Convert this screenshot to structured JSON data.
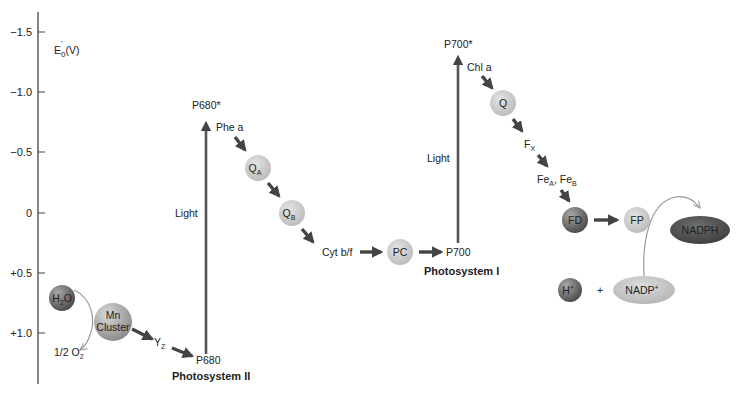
{
  "diagram": {
    "axis": {
      "label_main": "E",
      "label_sub": "0",
      "label_sup": "'",
      "label_unit": "(V)",
      "ticks": [
        "−1.5",
        "−1.0",
        "−0.5",
        "0",
        "+0.5",
        "+1.0"
      ]
    },
    "photosystem_ii": {
      "title": "Photosystem II",
      "light": "Light",
      "p680_excited": "P680*",
      "p680": "P680",
      "phe": "Phe a",
      "qa_main": "Q",
      "qa_sub": "A",
      "qb_main": "Q",
      "qb_sub": "B",
      "h2o_main": "H",
      "h2o_sub": "2",
      "h2o_end": "O",
      "mn_line1": "Mn",
      "mn_line2": "Cluster",
      "yz_main": "Y",
      "yz_sub": "Z",
      "o2_main": "1/2 O",
      "o2_sub": "2"
    },
    "cytochrome": "Cyt b/f",
    "plastocyanin": "PC",
    "photosystem_i": {
      "title": "Photosystem I",
      "light": "Light",
      "p700_excited": "P700*",
      "p700": "P700",
      "chl": "Chl a",
      "q": "Q",
      "fx_main": "F",
      "fx_sub": "X",
      "fea_main": "Fe",
      "fea_sub": "A",
      "sep": ",",
      "feb_main": " Fe",
      "feb_sub": "B",
      "fd": "FD",
      "fp": "FP",
      "nadph": "NADPH",
      "h_main": "H",
      "h_sup": "+",
      "plus": "+",
      "nadp_main": "NADP",
      "nadp_sup": "+"
    },
    "colors": {
      "arrow": "#4a4a4a",
      "light_bar": "#555555",
      "carrier_light": "#c8c8c8",
      "carrier_dark": "#7a7a7a",
      "nadph": "#5a5a5a",
      "nadp": "#bdbdbd"
    }
  }
}
